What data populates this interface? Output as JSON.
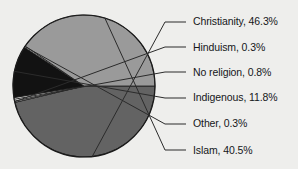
{
  "chart_data": {
    "type": "pie",
    "title": "",
    "subtitle": "",
    "xlabel": "",
    "ylabel": "",
    "legend_position": "right-callout-labels",
    "grid": false,
    "categories": [
      "Christianity",
      "Hinduism",
      "No religion",
      "Indigenous",
      "Other",
      "Islam"
    ],
    "values": [
      46.3,
      0.3,
      0.8,
      11.8,
      0.3,
      40.5
    ],
    "units": "percent",
    "slices": [
      {
        "name": "Christianity",
        "value": 46.3,
        "label": "Christianity, 46.3%",
        "color": "#636363"
      },
      {
        "name": "Hinduism",
        "value": 0.3,
        "label": "Hinduism, 0.3%",
        "color": "#f4f4f2"
      },
      {
        "name": "No religion",
        "value": 0.8,
        "label": "No religion, 0.8%",
        "color": "#f4f4f2"
      },
      {
        "name": "Indigenous",
        "value": 11.8,
        "label": "Indigenous, 11.8%",
        "color": "#121212"
      },
      {
        "name": "Other",
        "value": 0.3,
        "label": "Other, 0.3%",
        "color": "#f4f4f2"
      },
      {
        "name": "Islam",
        "value": 40.5,
        "label": "Islam, 40.5%",
        "color": "#9a9a9a"
      }
    ],
    "colors": {
      "background": "#eeeeec",
      "outline": "#1a1a1a",
      "leader_line": "#2b2b2b",
      "text": "#15171a"
    },
    "geometry": {
      "center_x": 84,
      "center_y": 86,
      "radius": 71,
      "start_angle_deg": 0,
      "direction": "clockwise"
    }
  },
  "labels": {
    "christianity": "Christianity, 46.3%",
    "hinduism": "Hinduism, 0.3%",
    "no_religion": "No religion, 0.8%",
    "indigenous": "Indigenous, 11.8%",
    "other": "Other, 0.3%",
    "islam": "Islam, 40.5%"
  }
}
